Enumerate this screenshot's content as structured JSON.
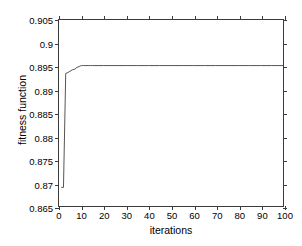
{
  "chart_data": {
    "type": "line",
    "title": "",
    "xlabel": "iterations",
    "ylabel": "fitness function",
    "xlim": [
      0,
      100
    ],
    "ylim": [
      0.865,
      0.905
    ],
    "grid": false,
    "legend": null,
    "line_color": "#555555",
    "axis_color": "#3b3b3b",
    "background": "#ffffff",
    "xticks": [
      0,
      10,
      20,
      30,
      40,
      50,
      60,
      70,
      80,
      90,
      100
    ],
    "xtick_labels": [
      "0",
      "10",
      "20",
      "30",
      "40",
      "50",
      "60",
      "70",
      "80",
      "90",
      "100"
    ],
    "yticks": [
      0.865,
      0.87,
      0.875,
      0.88,
      0.885,
      0.89,
      0.895,
      0.9,
      0.905
    ],
    "ytick_labels": [
      "0.865",
      "0.87",
      "0.875",
      "0.88",
      "0.885",
      "0.89",
      "0.895",
      "0.9",
      "0.905"
    ],
    "series": [
      {
        "name": "best fitness",
        "x": [
          1,
          2,
          3,
          4,
          5,
          6,
          7,
          8,
          9,
          10,
          11,
          12,
          13,
          14,
          15,
          20,
          25,
          30,
          35,
          40,
          45,
          50,
          55,
          60,
          65,
          70,
          75,
          80,
          85,
          90,
          95,
          100
        ],
        "y": [
          0.869,
          0.869,
          0.8935,
          0.8937,
          0.894,
          0.8943,
          0.8944,
          0.8948,
          0.895,
          0.8952,
          0.8952,
          0.8952,
          0.8952,
          0.8952,
          0.8952,
          0.8952,
          0.8952,
          0.8952,
          0.8952,
          0.8952,
          0.8952,
          0.8952,
          0.8952,
          0.8952,
          0.8952,
          0.8952,
          0.8952,
          0.8952,
          0.8952,
          0.8952,
          0.8952,
          0.8952
        ]
      }
    ],
    "annotations": {
      "start_value": "0.869",
      "plateau_value": "0.8952",
      "converged_at_iteration": "10"
    }
  }
}
